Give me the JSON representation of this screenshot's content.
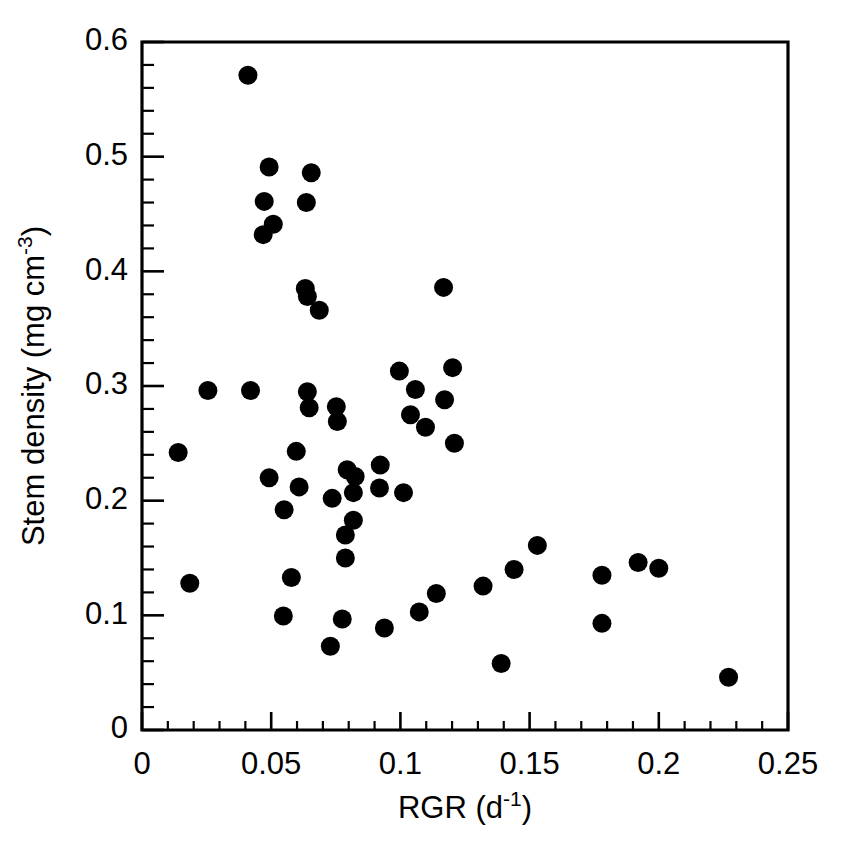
{
  "chart_data": {
    "type": "scatter",
    "title": "",
    "xlabel": "RGR (d-1)",
    "xlabel_base": "RGR (d",
    "xlabel_sup": "-1",
    "xlabel_tail": ")",
    "ylabel": "Stem density (mg cm-3)",
    "ylabel_base": "Stem density (mg cm",
    "ylabel_sup": "-3",
    "ylabel_tail": ")",
    "xlim": [
      0,
      0.25
    ],
    "ylim": [
      0,
      0.6
    ],
    "x_ticks": [
      0,
      0.05,
      0.1,
      0.15,
      0.2,
      0.25
    ],
    "x_tick_labels": [
      "0",
      "0.05",
      "0.1",
      "0.15",
      "0.2",
      "0.25"
    ],
    "y_ticks": [
      0,
      0.1,
      0.2,
      0.3,
      0.4,
      0.5,
      0.6
    ],
    "y_tick_labels": [
      "0",
      "0.1",
      "0.2",
      "0.3",
      "0.4",
      "0.5",
      "0.6"
    ],
    "x_minor_step": 0.01,
    "y_minor_step": 0.02,
    "grid": false,
    "legend": "none",
    "marker_color": "#000000",
    "marker_shape": "circle",
    "marker_radius_px": 9.5,
    "series": [
      {
        "name": "Stem density vs RGR",
        "points": [
          [
            0.041,
            0.571
          ],
          [
            0.0492,
            0.491
          ],
          [
            0.0655,
            0.486
          ],
          [
            0.0473,
            0.461
          ],
          [
            0.0636,
            0.46
          ],
          [
            0.0508,
            0.441
          ],
          [
            0.0469,
            0.432
          ],
          [
            0.0632,
            0.385
          ],
          [
            0.064,
            0.378
          ],
          [
            0.0686,
            0.366
          ],
          [
            0.1167,
            0.386
          ],
          [
            0.0996,
            0.313
          ],
          [
            0.1202,
            0.316
          ],
          [
            0.1058,
            0.297
          ],
          [
            0.1171,
            0.288
          ],
          [
            0.1039,
            0.275
          ],
          [
            0.1097,
            0.264
          ],
          [
            0.1209,
            0.25
          ],
          [
            0.0255,
            0.296
          ],
          [
            0.042,
            0.296
          ],
          [
            0.064,
            0.295
          ],
          [
            0.0647,
            0.281
          ],
          [
            0.0752,
            0.282
          ],
          [
            0.0756,
            0.269
          ],
          [
            0.014,
            0.242
          ],
          [
            0.0597,
            0.243
          ],
          [
            0.0492,
            0.22
          ],
          [
            0.0608,
            0.212
          ],
          [
            0.055,
            0.192
          ],
          [
            0.0736,
            0.202
          ],
          [
            0.0794,
            0.227
          ],
          [
            0.0825,
            0.221
          ],
          [
            0.0922,
            0.231
          ],
          [
            0.0818,
            0.207
          ],
          [
            0.0919,
            0.211
          ],
          [
            0.1012,
            0.207
          ],
          [
            0.0818,
            0.183
          ],
          [
            0.0787,
            0.17
          ],
          [
            0.0787,
            0.15
          ],
          [
            0.0578,
            0.133
          ],
          [
            0.0185,
            0.128
          ],
          [
            0.0547,
            0.0994
          ],
          [
            0.0775,
            0.0968
          ],
          [
            0.0729,
            0.073
          ],
          [
            0.0938,
            0.0889
          ],
          [
            0.1073,
            0.103
          ],
          [
            0.1139,
            0.119
          ],
          [
            0.132,
            0.1255
          ],
          [
            0.144,
            0.14
          ],
          [
            0.153,
            0.161
          ],
          [
            0.178,
            0.135
          ],
          [
            0.192,
            0.146
          ],
          [
            0.2,
            0.141
          ],
          [
            0.178,
            0.093
          ],
          [
            0.139,
            0.058
          ],
          [
            0.227,
            0.046
          ]
        ]
      }
    ]
  },
  "axes": {
    "frame_color": "#000000"
  }
}
